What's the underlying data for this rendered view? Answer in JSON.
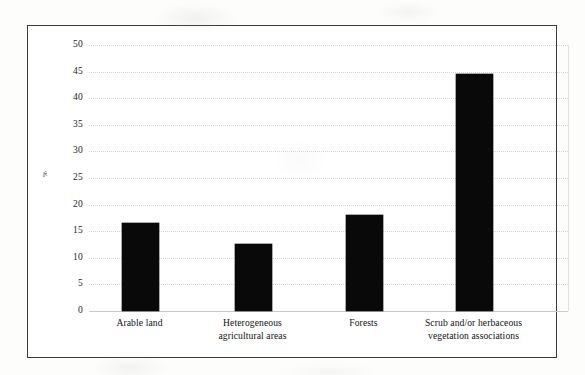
{
  "chart_data": {
    "type": "bar",
    "title": "",
    "subtitle": "",
    "xlabel": "",
    "ylabel": "%",
    "categories": [
      "Arable land",
      "Heterogeneous agricultural areas",
      "Forests",
      "Scrub and/or herbaceous vegetation associations"
    ],
    "category_lines": [
      [
        "Arable land"
      ],
      [
        "Heterogeneous",
        "agricultural areas"
      ],
      [
        "Forests"
      ],
      [
        "Scrub and/or herbaceous",
        "vegetation associations"
      ]
    ],
    "values": [
      16.5,
      12.6,
      18.0,
      44.5
    ],
    "ylim": [
      0,
      50
    ],
    "ytick_values": [
      0,
      5,
      10,
      15,
      20,
      25,
      30,
      35,
      40,
      45,
      50
    ],
    "ytick_labels": [
      "0",
      "5",
      "10",
      "15",
      "20",
      "25",
      "30",
      "35",
      "40",
      "45",
      "50"
    ],
    "grid": true,
    "legend": false,
    "legend_position": "none",
    "bar_color": "#090909",
    "gridline_color": "#d6d6d6",
    "frame_color": "#3b3b3b",
    "background_color": "#ffffff"
  }
}
